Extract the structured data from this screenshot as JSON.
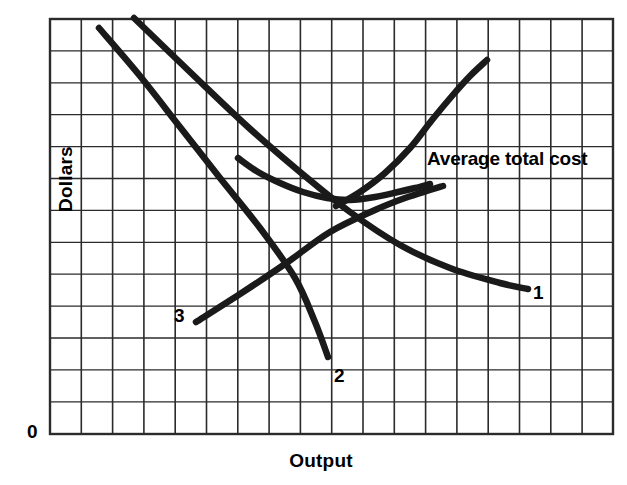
{
  "chart_data": {
    "type": "line",
    "title": "",
    "xlabel": "Output",
    "ylabel": "Dollars",
    "origin_label": "0",
    "grid": true,
    "grid_color": "#2b2b2b",
    "curve_color": "#1a1a1a",
    "background": "#ffffff",
    "plot_area": {
      "left": 50,
      "top": 19,
      "right": 613,
      "bottom": 434
    },
    "grid_spacing": {
      "x": 31.3,
      "y": 31.9
    },
    "axis_ranges": {
      "xlim": [
        0,
        18
      ],
      "ylim": [
        0,
        13
      ]
    },
    "legend_position": "inline-annotation",
    "annotations": [
      {
        "text": "Average total cost",
        "x": 427,
        "y": 160
      }
    ],
    "series": [
      {
        "name": "Average total cost",
        "label": "Average total cost",
        "label_kind": "annotation",
        "shape": "u-curve",
        "points": [
          [
            238,
            158
          ],
          [
            258,
            172
          ],
          [
            280,
            183
          ],
          [
            303,
            192
          ],
          [
            327,
            198
          ],
          [
            350,
            200
          ],
          [
            375,
            197
          ],
          [
            398,
            192
          ],
          [
            415,
            188
          ],
          [
            430,
            184
          ]
        ]
      },
      {
        "name": "curve-1",
        "label": "1",
        "label_kind": "end-label",
        "label_position": [
          533,
          292
        ],
        "shape": "descending-line",
        "points": [
          [
            134,
            18
          ],
          [
            190,
            72
          ],
          [
            248,
            127
          ],
          [
            300,
            172
          ],
          [
            350,
            212
          ],
          [
            400,
            245
          ],
          [
            450,
            268
          ],
          [
            500,
            283
          ],
          [
            528,
            289
          ]
        ]
      },
      {
        "name": "curve-2",
        "label": "2",
        "label_kind": "end-label",
        "label_position": [
          334,
          375
        ],
        "shape": "descending-line",
        "points": [
          [
            99,
            28
          ],
          [
            140,
            76
          ],
          [
            180,
            127
          ],
          [
            220,
            178
          ],
          [
            260,
            228
          ],
          [
            295,
            278
          ],
          [
            315,
            322
          ],
          [
            328,
            357
          ]
        ]
      },
      {
        "name": "curve-3",
        "label": "3",
        "label_kind": "start-label",
        "label_position": [
          174,
          315
        ],
        "shape": "ascending-line",
        "points": [
          [
            196,
            322
          ],
          [
            240,
            294
          ],
          [
            285,
            264
          ],
          [
            330,
            232
          ],
          [
            375,
            210
          ],
          [
            405,
            198
          ],
          [
            430,
            190
          ],
          [
            443,
            186
          ]
        ]
      },
      {
        "name": "marginal-cost",
        "label": "",
        "label_kind": "none",
        "shape": "ascending-curve",
        "points": [
          [
            336,
            206
          ],
          [
            360,
            192
          ],
          [
            385,
            173
          ],
          [
            410,
            148
          ],
          [
            432,
            120
          ],
          [
            452,
            96
          ],
          [
            470,
            76
          ],
          [
            487,
            60
          ]
        ]
      }
    ]
  },
  "labels": {
    "ylabel": "Dollars",
    "xlabel": "Output",
    "origin": "0",
    "curve1": "1",
    "curve2": "2",
    "curve3": "3",
    "atc": "Average total cost"
  }
}
